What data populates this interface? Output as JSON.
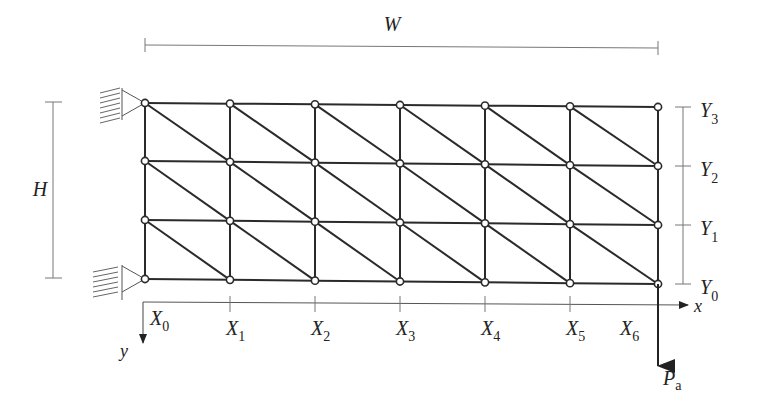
{
  "figure": {
    "type": "truss-grid",
    "colors": {
      "line": "#2a2a2a",
      "dim": "#777777",
      "node_fill": "#ffffff",
      "background": "#ffffff"
    }
  },
  "dimensions": {
    "width_label": "W",
    "height_label": "H"
  },
  "axes": {
    "x_label": "x",
    "y_label": "y",
    "x_ticks": [
      {
        "main": "X",
        "sub": "0"
      },
      {
        "main": "X",
        "sub": "1"
      },
      {
        "main": "X",
        "sub": "2"
      },
      {
        "main": "X",
        "sub": "3"
      },
      {
        "main": "X",
        "sub": "4"
      },
      {
        "main": "X",
        "sub": "5"
      },
      {
        "main": "X",
        "sub": "6"
      }
    ],
    "y_ticks": [
      {
        "main": "Y",
        "sub": "0"
      },
      {
        "main": "Y",
        "sub": "1"
      },
      {
        "main": "Y",
        "sub": "2"
      },
      {
        "main": "Y",
        "sub": "3"
      }
    ]
  },
  "load": {
    "main": "P",
    "sub": "a"
  },
  "grid": {
    "columns": 7,
    "rows": 4,
    "col_x": [
      145,
      230,
      315,
      400,
      485,
      570,
      658
    ],
    "row_y_left": [
      103,
      161,
      220,
      279
    ],
    "row_y_right": [
      107,
      166,
      225,
      284
    ]
  }
}
